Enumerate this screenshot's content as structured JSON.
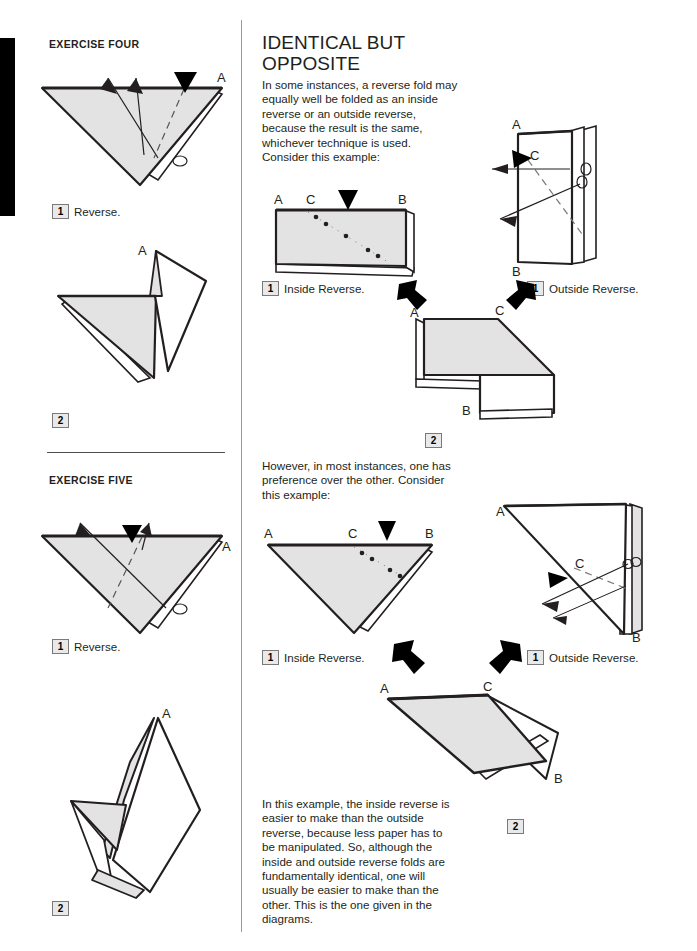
{
  "page": {
    "background_color": "#ffffff",
    "paper_fill_color": "#e3e3e3",
    "ink_color": "#231f20",
    "thumb_tab_color": "#000000"
  },
  "left_column": {
    "exercise_four": {
      "heading": "EXERCISE FOUR",
      "steps": [
        {
          "number": "1",
          "label": "Reverse.",
          "point_labels": [
            "A"
          ]
        },
        {
          "number": "2",
          "label": "",
          "point_labels": [
            "A"
          ]
        }
      ]
    },
    "exercise_five": {
      "heading": "EXERCISE FIVE",
      "steps": [
        {
          "number": "1",
          "label": "Reverse.",
          "point_labels": [
            "A"
          ]
        },
        {
          "number": "2",
          "label": "",
          "point_labels": [
            "A"
          ]
        }
      ]
    }
  },
  "right_column": {
    "heading": "IDENTICAL BUT OPPOSITE",
    "paragraph_1": "In some instances, a reverse fold may equally well be folded as an inside reverse or an outside reverse, because the result is the same, whichever technique is used. Consider this example:",
    "paragraph_2": "However, in most instances, one has preference over the other. Consider this example:",
    "paragraph_3": "In this example, the inside reverse is easier to make than the outside reverse, because less paper has to be manipulated. So, although the inside and outside reverse folds are fundamentally identical, one will usually be easier to make than the other. This is the one given in the diagrams.",
    "example_one": {
      "inside": {
        "number": "1",
        "label": "Inside Reverse.",
        "point_labels": [
          "A",
          "C",
          "B"
        ]
      },
      "outside": {
        "number": "1",
        "label": "Outside Reverse.",
        "point_labels": [
          "A",
          "C",
          "B"
        ]
      },
      "result": {
        "number": "2",
        "label": "",
        "point_labels": [
          "A",
          "C",
          "B"
        ]
      }
    },
    "example_two": {
      "inside": {
        "number": "1",
        "label": "Inside Reverse.",
        "point_labels": [
          "A",
          "C",
          "B"
        ]
      },
      "outside": {
        "number": "1",
        "label": "Outside Reverse.",
        "point_labels": [
          "A",
          "C",
          "B"
        ]
      },
      "result": {
        "number": "2",
        "label": "",
        "point_labels": [
          "A",
          "C",
          "B"
        ]
      }
    }
  }
}
